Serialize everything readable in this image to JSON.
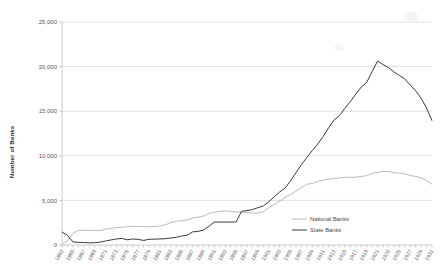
{
  "chart_data": {
    "type": "line",
    "title": "",
    "xlabel": "",
    "ylabel": "Number of Banks",
    "ylim": [
      0,
      25000
    ],
    "xlim": [
      1863,
      1931
    ],
    "grid": true,
    "legend_position": "inside-bottom-right",
    "ytick_labels": [
      "0",
      "5,000",
      "10,000",
      "15,000",
      "20,000",
      "25,000"
    ],
    "ytick_values": [
      0,
      5000,
      10000,
      15000,
      20000,
      25000
    ],
    "xtick_labels": [
      "1863",
      "1865",
      "1867",
      "1869",
      "1871",
      "1873",
      "1875",
      "1877",
      "1879",
      "1881",
      "1883",
      "1885",
      "1887",
      "1889",
      "1891",
      "1893",
      "1895",
      "1897",
      "1899",
      "1901",
      "1903",
      "1905",
      "1907",
      "1909",
      "1911",
      "1913",
      "1915",
      "1917",
      "1919",
      "1921",
      "1923",
      "1925",
      "1927",
      "1929",
      "1931"
    ],
    "x": [
      1863,
      1864,
      1865,
      1866,
      1867,
      1868,
      1869,
      1870,
      1871,
      1872,
      1873,
      1874,
      1875,
      1876,
      1877,
      1878,
      1879,
      1880,
      1881,
      1882,
      1883,
      1884,
      1885,
      1886,
      1887,
      1888,
      1889,
      1890,
      1891,
      1892,
      1893,
      1894,
      1895,
      1896,
      1897,
      1898,
      1899,
      1900,
      1901,
      1902,
      1903,
      1904,
      1905,
      1906,
      1907,
      1908,
      1909,
      1910,
      1911,
      1912,
      1913,
      1914,
      1915,
      1916,
      1917,
      1918,
      1919,
      1920,
      1921,
      1922,
      1923,
      1924,
      1925,
      1926,
      1927,
      1928,
      1929,
      1930,
      1931
    ],
    "series": [
      {
        "name": "National Banks",
        "color": "#a8a8a8",
        "values": [
          66,
          467,
          1294,
          1634,
          1636,
          1640,
          1619,
          1612,
          1767,
          1853,
          1968,
          1983,
          2076,
          2091,
          2078,
          2056,
          2048,
          2076,
          2132,
          2269,
          2501,
          2664,
          2714,
          2809,
          3014,
          3120,
          3239,
          3540,
          3677,
          3759,
          3807,
          3770,
          3715,
          3689,
          3610,
          3581,
          3583,
          3731,
          4163,
          4534,
          4935,
          5327,
          5664,
          6046,
          6422,
          6821,
          6884,
          7138,
          7270,
          7372,
          7467,
          7518,
          7605,
          7579,
          7599,
          7691,
          7770,
          8024,
          8154,
          8249,
          8241,
          8085,
          8066,
          7978,
          7790,
          7685,
          7530,
          7247,
          6805
        ]
      },
      {
        "name": "State Banks",
        "color": "#3b3b3b",
        "values": [
          1466,
          1089,
          349,
          297,
          272,
          247,
          259,
          325,
          452,
          566,
          679,
          737,
          586,
          671,
          631,
          510,
          648,
          650,
          683,
          704,
          788,
          852,
          1015,
          1090,
          1471,
          1523,
          1671,
          2101,
          2572,
          2572,
          2572,
          2572,
          2572,
          3774,
          3857,
          3965,
          4191,
          4369,
          4851,
          5397,
          5946,
          6384,
          7189,
          8101,
          9018,
          9802,
          10586,
          11319,
          12159,
          13148,
          14011,
          14512,
          15330,
          16090,
          16923,
          17708,
          18227,
          19452,
          20635,
          20230,
          19904,
          19395,
          19018,
          18607,
          17935,
          17283,
          16453,
          15345,
          13935
        ]
      }
    ],
    "legend": [
      {
        "label": "National Banks",
        "color": "#a8a8a8"
      },
      {
        "label": "State Banks",
        "color": "#3b3b3b"
      }
    ]
  }
}
